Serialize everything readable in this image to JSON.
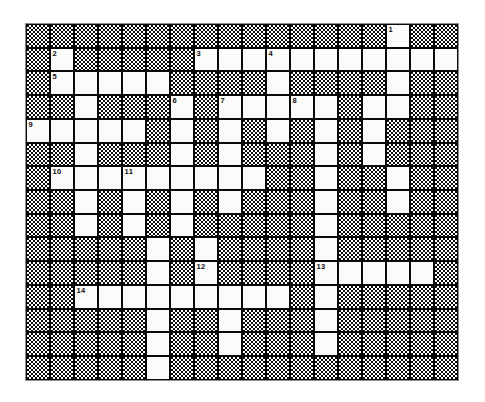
{
  "puzzle": {
    "title": "Crossword Puzzle Grid",
    "columns": 18,
    "rows": 15,
    "cell_size_px": 24,
    "colors": {
      "open_cell": "#fbfbf9",
      "block_cell": "#0d0d0d",
      "grid_line": "#0a0a0a",
      "number_text": "#101010",
      "page_background": "#ffffff"
    },
    "grid_legend": {
      "1": "open (white, letter) square",
      "0": "blocked (shaded/hatched) square"
    },
    "grid": [
      [
        0,
        0,
        0,
        0,
        0,
        0,
        0,
        0,
        0,
        0,
        0,
        0,
        0,
        0,
        0,
        1,
        0,
        0
      ],
      [
        0,
        1,
        0,
        0,
        0,
        0,
        0,
        1,
        1,
        1,
        1,
        1,
        1,
        1,
        1,
        1,
        1,
        1
      ],
      [
        0,
        1,
        1,
        1,
        1,
        1,
        0,
        0,
        0,
        0,
        1,
        0,
        0,
        0,
        0,
        1,
        0,
        0
      ],
      [
        0,
        0,
        1,
        0,
        0,
        0,
        1,
        0,
        1,
        1,
        1,
        1,
        1,
        0,
        1,
        1,
        0,
        0
      ],
      [
        1,
        1,
        1,
        1,
        1,
        0,
        1,
        0,
        1,
        0,
        1,
        0,
        1,
        0,
        1,
        0,
        0,
        0
      ],
      [
        0,
        0,
        1,
        0,
        0,
        0,
        1,
        0,
        1,
        0,
        0,
        0,
        1,
        0,
        1,
        0,
        0,
        0
      ],
      [
        0,
        1,
        1,
        1,
        1,
        1,
        1,
        1,
        1,
        1,
        0,
        0,
        1,
        0,
        0,
        1,
        0,
        0
      ],
      [
        0,
        0,
        1,
        0,
        1,
        0,
        1,
        0,
        1,
        0,
        0,
        0,
        1,
        0,
        0,
        1,
        0,
        0
      ],
      [
        0,
        0,
        1,
        0,
        1,
        0,
        1,
        0,
        0,
        0,
        0,
        0,
        1,
        0,
        0,
        0,
        0,
        0
      ],
      [
        0,
        0,
        0,
        0,
        0,
        1,
        0,
        1,
        0,
        0,
        0,
        0,
        1,
        0,
        0,
        0,
        0,
        0
      ],
      [
        0,
        0,
        0,
        0,
        0,
        1,
        0,
        1,
        0,
        0,
        0,
        0,
        1,
        1,
        1,
        1,
        1,
        0
      ],
      [
        0,
        0,
        1,
        1,
        1,
        1,
        1,
        1,
        1,
        1,
        1,
        0,
        1,
        0,
        0,
        0,
        0,
        0
      ],
      [
        0,
        0,
        0,
        0,
        0,
        1,
        0,
        0,
        1,
        0,
        0,
        0,
        1,
        0,
        0,
        0,
        0,
        0
      ],
      [
        0,
        0,
        0,
        0,
        0,
        1,
        0,
        0,
        1,
        0,
        0,
        0,
        1,
        0,
        0,
        0,
        0,
        0
      ],
      [
        0,
        0,
        0,
        0,
        0,
        1,
        0,
        0,
        0,
        0,
        0,
        0,
        0,
        0,
        0,
        0,
        0,
        0
      ]
    ],
    "numbers": [
      {
        "clue": "1",
        "row": 0,
        "col": 15
      },
      {
        "clue": "2",
        "row": 1,
        "col": 1
      },
      {
        "clue": "3",
        "row": 1,
        "col": 7
      },
      {
        "clue": "4",
        "row": 1,
        "col": 10
      },
      {
        "clue": "5",
        "row": 2,
        "col": 1
      },
      {
        "clue": "6",
        "row": 3,
        "col": 6
      },
      {
        "clue": "7",
        "row": 3,
        "col": 8
      },
      {
        "clue": "8",
        "row": 3,
        "col": 11
      },
      {
        "clue": "9",
        "row": 4,
        "col": 0
      },
      {
        "clue": "10",
        "row": 6,
        "col": 1
      },
      {
        "clue": "11",
        "row": 6,
        "col": 4
      },
      {
        "clue": "12",
        "row": 10,
        "col": 7
      },
      {
        "clue": "13",
        "row": 10,
        "col": 12
      },
      {
        "clue": "14",
        "row": 11,
        "col": 2
      }
    ]
  }
}
